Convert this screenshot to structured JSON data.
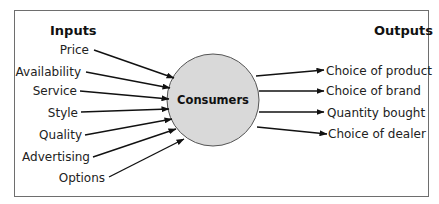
{
  "diagram": {
    "inputs_heading": "Inputs",
    "outputs_heading": "Outputs",
    "center": {
      "label": "Consumers",
      "fill": "#d9d9d9",
      "stroke": "#555555"
    },
    "inputs": [
      {
        "label": "Price"
      },
      {
        "label": "Availability"
      },
      {
        "label": "Service"
      },
      {
        "label": "Style"
      },
      {
        "label": "Quality"
      },
      {
        "label": "Advertising"
      },
      {
        "label": "Options"
      }
    ],
    "outputs": [
      {
        "label": "Choice of product"
      },
      {
        "label": "Choice of brand"
      },
      {
        "label": "Quantity bought"
      },
      {
        "label": "Choice of dealer"
      }
    ]
  }
}
